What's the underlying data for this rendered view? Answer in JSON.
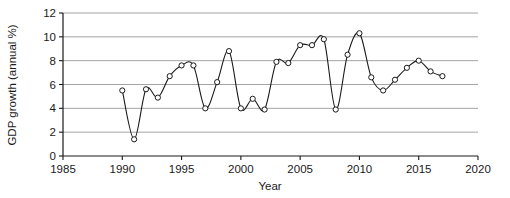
{
  "chart_data": {
    "type": "line",
    "title": "",
    "subtitle": "",
    "xlabel": "Year",
    "ylabel": "GDP growth (annual %)",
    "xlim": [
      1985,
      2020
    ],
    "ylim": [
      0,
      12
    ],
    "xticks": [
      1985,
      1990,
      1995,
      2000,
      2005,
      2010,
      2015,
      2020
    ],
    "xtick_labels": [
      "1985",
      "1990",
      "1995",
      "2000",
      "2005",
      "2010",
      "2015",
      "2020"
    ],
    "yticks": [
      0,
      2,
      4,
      6,
      8,
      10,
      12
    ],
    "ytick_labels": [
      "0",
      "2",
      "4",
      "6",
      "8",
      "10",
      "12"
    ],
    "grid": "horizontal",
    "legend": "none",
    "marker": "open-circle",
    "line_color": "#1a1a1a",
    "grid_color": "#9a9a9a",
    "axis_color": "#1a1a1a",
    "marker_fill": "#ffffff",
    "smoothing": "spline",
    "x": [
      1990,
      1991,
      1992,
      1993,
      1994,
      1995,
      1996,
      1997,
      1998,
      1999,
      2000,
      2001,
      2002,
      2003,
      2004,
      2005,
      2006,
      2007,
      2008,
      2009,
      2010,
      2011,
      2012,
      2013,
      2014,
      2015,
      2016,
      2017
    ],
    "values": [
      5.5,
      1.4,
      5.6,
      4.9,
      6.7,
      7.6,
      7.6,
      4.0,
      6.2,
      8.8,
      4.0,
      4.8,
      3.9,
      7.9,
      7.8,
      9.3,
      9.3,
      9.8,
      3.9,
      8.5,
      10.3,
      6.6,
      5.5,
      6.4,
      7.4,
      8.0,
      7.1,
      6.7
    ],
    "series": [
      {
        "name": "GDP growth (annual %)",
        "values": [
          5.5,
          1.4,
          5.6,
          4.9,
          6.7,
          7.6,
          7.6,
          4.0,
          6.2,
          8.8,
          4.0,
          4.8,
          3.9,
          7.9,
          7.8,
          9.3,
          9.3,
          9.8,
          3.9,
          8.5,
          10.3,
          6.6,
          5.5,
          6.4,
          7.4,
          8.0,
          7.1,
          6.7
        ]
      }
    ]
  }
}
